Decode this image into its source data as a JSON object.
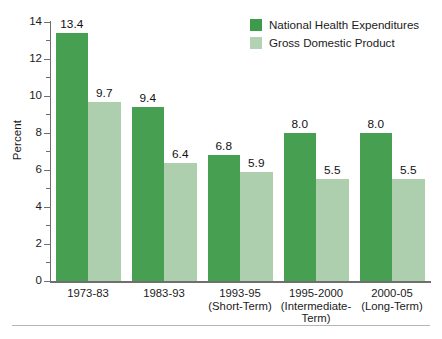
{
  "chart_data": {
    "type": "bar",
    "title": "",
    "subtitle": "",
    "xlabel": "",
    "ylabel": "Percent",
    "ylim": [
      0,
      14
    ],
    "ytick_step": 2,
    "yminor_step": 1,
    "ytick_labels": [
      "0",
      "2",
      "4",
      "6",
      "8",
      "10",
      "12",
      "14"
    ],
    "grid": false,
    "legend_position": "top-right",
    "categories": [
      "1973-83",
      "1983-93",
      "1993-95\n(Short-Term)",
      "1995-2000\n(Intermediate-\nTerm)",
      "2000-05\n(Long-Term)"
    ],
    "series": [
      {
        "name": "National Health Expenditures",
        "color": "#479f52",
        "values": [
          13.4,
          9.4,
          6.8,
          8.0,
          8.0
        ],
        "labels": [
          "13.4",
          "9.4",
          "6.8",
          "8.0",
          "8.0"
        ]
      },
      {
        "name": "Gross Domestic Product",
        "color": "#aecfae",
        "values": [
          9.7,
          6.4,
          5.9,
          5.5,
          5.5
        ],
        "labels": [
          "9.7",
          "6.4",
          "5.9",
          "5.5",
          "5.5"
        ]
      }
    ]
  },
  "legend": {
    "items": [
      {
        "label": "National Health Expenditures",
        "color": "#3f9b4c"
      },
      {
        "label": "Gross Domestic Product",
        "color": "#b3d2b3"
      }
    ]
  },
  "axes": {
    "y_title": "Percent"
  }
}
